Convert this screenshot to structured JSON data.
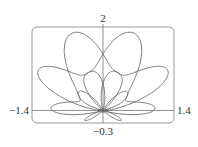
{
  "chart_data": {
    "type": "line",
    "subtype": "polar-parametric",
    "title": "",
    "xlabel": "",
    "ylabel": "",
    "equation": "r = sin(theta) + sin^3(5*theta/2)",
    "theta_range": [
      0,
      12.566370614359172
    ],
    "samples": 1600,
    "xlim": [
      -1.4,
      1.4
    ],
    "ylim": [
      -0.3,
      2
    ],
    "tick_labels": {
      "x_min": "−1.4",
      "x_max": "1.4",
      "y_min": "−0.3",
      "y_max": "2"
    },
    "grid": false,
    "legend": null,
    "colors": {
      "curve": "#666666",
      "axes": "#777777",
      "frame": "#999999",
      "text": "#333333"
    }
  }
}
